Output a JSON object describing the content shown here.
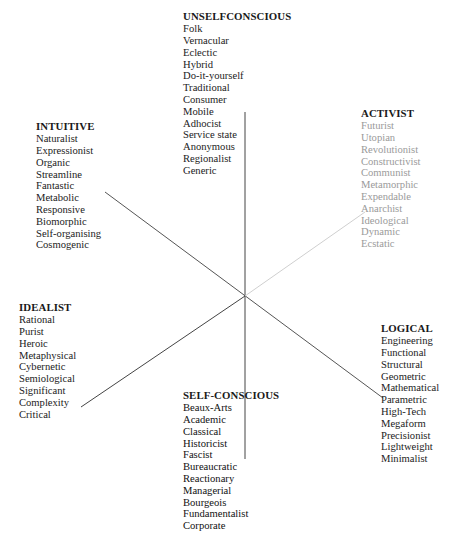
{
  "diagram": {
    "type": "radial-classification",
    "center": [
      245,
      296
    ],
    "colors": {
      "axis_dark": "#444444",
      "axis_light": "#c8c8c8",
      "text": "#222222",
      "text_faded": "#9a9a9a"
    }
  },
  "groups": {
    "unselfconscious": {
      "title": "UNSELFCONSCIOUS",
      "items": [
        "Folk",
        "Vernacular",
        "Eclectic",
        "Hybrid",
        "Do-it-yourself",
        "Traditional",
        "Consumer",
        "Mobile",
        "Adhocist",
        "Service state",
        "Anonymous",
        "Regionalist",
        "Generic"
      ]
    },
    "intuitive": {
      "title": "INTUITIVE",
      "items": [
        "Naturalist",
        "Expressionist",
        "Organic",
        "Streamline",
        "Fantastic",
        "Metabolic",
        "Responsive",
        "Biomorphic",
        "Self-organising",
        "Cosmogenic"
      ]
    },
    "activist": {
      "title": "ACTIVIST",
      "items": [
        "Futurist",
        "Utopian",
        "Revolutionist",
        "Constructivist",
        "Communist",
        "Metamorphic",
        "Expendable",
        "Anarchist",
        "Ideological",
        "Dynamic",
        "Ecstatic"
      ]
    },
    "idealist": {
      "title": "IDEALIST",
      "items": [
        "Rational",
        "Purist",
        "Heroic",
        "Metaphysical",
        "Cybernetic",
        "Semiological",
        "Significant",
        "Complexity",
        "Critical"
      ]
    },
    "logical": {
      "title": "LOGICAL",
      "items": [
        "Engineering",
        "Functional",
        "Structural",
        "Geometric",
        "Mathematical",
        "Parametric",
        "High-Tech",
        "Megaform",
        "Precisionist",
        "Lightweight",
        "Minimalist"
      ]
    },
    "selfconscious": {
      "title": "SELF-CONSCIOUS",
      "items": [
        "Beaux-Arts",
        "Academic",
        "Classical",
        "Historicist",
        "Fascist",
        "Bureaucratic",
        "Reactionary",
        "Managerial",
        "Bourgeois",
        "Fundamentalist",
        "Corporate"
      ]
    }
  }
}
